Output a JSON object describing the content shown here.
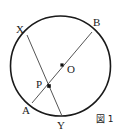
{
  "figure": {
    "caption": "図 1",
    "width": 123,
    "height": 135,
    "background_color": "#ffffff",
    "stroke_color_circle": "#1a1a1a",
    "stroke_color_chord": "#555555",
    "point_color": "#111111"
  },
  "circle": {
    "label": "circle-O",
    "center_x": 60.5,
    "center_y": 66,
    "radius": 50,
    "stroke_width": 1.6
  },
  "points": [
    {
      "id": "X",
      "label": "X",
      "x": 27,
      "y": 35,
      "label_x": 16,
      "label_y": 24,
      "on_circle": true,
      "dot": false
    },
    {
      "id": "B",
      "label": "B",
      "x": 92,
      "y": 32,
      "label_x": 93,
      "label_y": 17,
      "on_circle": true,
      "dot": false
    },
    {
      "id": "O",
      "label": "O",
      "x": 62,
      "y": 65,
      "label_x": 67,
      "label_y": 64,
      "on_circle": false,
      "dot": true
    },
    {
      "id": "P",
      "label": "P",
      "x": 49,
      "y": 86,
      "label_x": 36,
      "label_y": 79,
      "on_circle": false,
      "dot": true
    },
    {
      "id": "A",
      "label": "A",
      "x": 32,
      "y": 103,
      "label_x": 22,
      "label_y": 105,
      "on_circle": true,
      "dot": false
    },
    {
      "id": "Y",
      "label": "Y",
      "x": 62,
      "y": 116,
      "label_x": 57,
      "label_y": 120,
      "on_circle": true,
      "dot": false
    }
  ],
  "chords": [
    {
      "id": "XY",
      "from": "X",
      "to": "Y",
      "x1": 27,
      "y1": 35,
      "x2": 62,
      "y2": 116
    },
    {
      "id": "AB",
      "from": "A",
      "to": "B",
      "x1": 32,
      "y1": 103,
      "x2": 92,
      "y2": 32
    }
  ]
}
